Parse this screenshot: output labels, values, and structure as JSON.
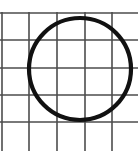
{
  "figure": {
    "panel_label": "B",
    "caption_position": "top-center",
    "background_color": "#ffffff",
    "width_px": 138,
    "height_px": 151
  },
  "chart_data": {
    "type": "scatter",
    "title": "B",
    "subtitle": "",
    "xlabel": "",
    "ylabel": "",
    "grid": true,
    "legend": false,
    "legend_position": "none",
    "xlim": [
      0,
      138
    ],
    "ylim": [
      0,
      151
    ],
    "grid_spec": {
      "line_color": "#4d4d4d",
      "line_width_px": 1.6,
      "vertical_lines_x": [
        2,
        29,
        57,
        85,
        112
      ],
      "horizontal_lines_y": [
        13,
        40,
        68,
        95,
        122
      ],
      "cell_size_px": 27.5,
      "columns_visible": 5,
      "rows_visible": 5
    },
    "shapes": [
      {
        "name": "circle",
        "type": "circle",
        "center_x": 80,
        "center_y": 69,
        "radius": 51,
        "stroke_color": "#111111",
        "stroke_width_px": 4.2,
        "fill": "none"
      }
    ],
    "series": [
      {
        "name": "circle-outline",
        "values": []
      }
    ],
    "annotations": [
      {
        "text": "B",
        "x": 69,
        "y": 0,
        "role": "panel-letter"
      }
    ]
  }
}
